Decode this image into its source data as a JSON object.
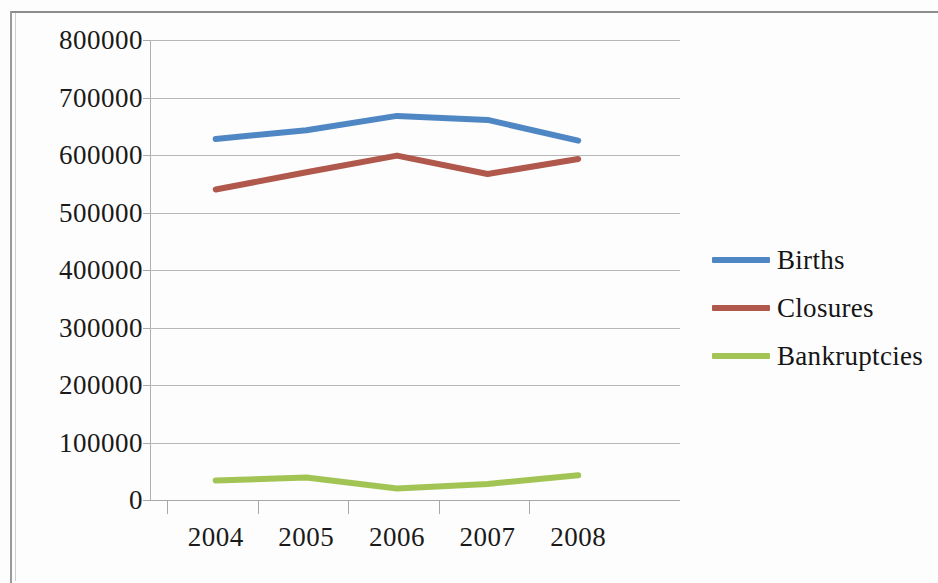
{
  "chart_data": {
    "type": "line",
    "title": "",
    "xlabel": "",
    "ylabel": "",
    "categories": [
      "2004",
      "2005",
      "2006",
      "2007",
      "2008"
    ],
    "ytick_labels": [
      "800000",
      "700000",
      "600000",
      "500000",
      "400000",
      "300000",
      "200000",
      "100000",
      "0"
    ],
    "ytick_values": [
      800000,
      700000,
      600000,
      500000,
      400000,
      300000,
      200000,
      100000,
      0
    ],
    "ylim": [
      0,
      800000
    ],
    "grid": true,
    "legend_position": "right",
    "series": [
      {
        "name": "Births",
        "color": "#4f87c4",
        "values": [
          628000,
          643000,
          668000,
          661000,
          625000
        ]
      },
      {
        "name": "Closures",
        "color": "#b0584c",
        "values": [
          540000,
          570000,
          599000,
          567000,
          593000
        ]
      },
      {
        "name": "Bankruptcies",
        "color": "#a2c455",
        "values": [
          34000,
          39000,
          20000,
          28000,
          43000
        ]
      }
    ]
  },
  "legend": {
    "items": [
      {
        "label": "Births",
        "swatch": "legend-swatch-births"
      },
      {
        "label": "Closures",
        "swatch": "legend-swatch-closures"
      },
      {
        "label": "Bankruptcies",
        "swatch": "legend-swatch-bankruptcies"
      }
    ]
  }
}
